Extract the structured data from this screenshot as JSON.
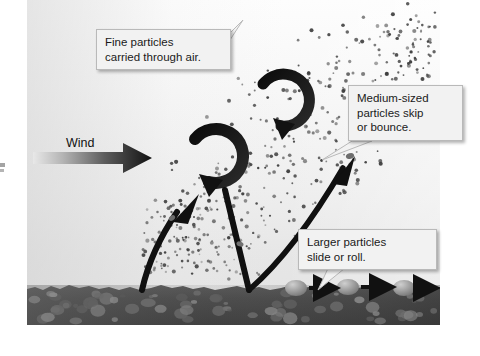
{
  "figure": {
    "type": "diagram",
    "panel": {
      "left": 27,
      "top": 0,
      "width": 413,
      "height": 325,
      "sky_color": "#eeeeee",
      "ground_color": "#4a4a4a",
      "ground_top": 277
    }
  },
  "wind": {
    "label": "Wind",
    "arrow": {
      "name": "wind-arrow",
      "direction": "right",
      "gradient_from": "#e3e3e3",
      "gradient_to": "#1a1a1a",
      "x1": 33,
      "y1": 158,
      "x2": 150,
      "y2": 158
    }
  },
  "callouts": [
    {
      "id": "fine",
      "text": "Fine particles\ncarried through air.",
      "box": {
        "left": 96,
        "top": 29,
        "width": 118
      },
      "tail_points": "214,55 244,22 214,70",
      "fill": "#f2f2f2",
      "border": "#b9b9b9"
    },
    {
      "id": "medium",
      "text": "Medium-sized\nparticles skip\nor bounce.",
      "box": {
        "left": 348,
        "top": 85,
        "width": 98
      },
      "tail_points": "352,143 322,160 372,143",
      "fill": "#f2f2f2",
      "border": "#b9b9b9"
    },
    {
      "id": "larger",
      "text": "Larger particles\nslide or roll.",
      "box": {
        "left": 298,
        "top": 229,
        "width": 122
      },
      "tail_points": "330,266 318,290 350,266",
      "fill": "#f2f2f2",
      "border": "#b9b9b9"
    }
  ],
  "swirls": [
    {
      "name": "swirl-upper",
      "cx": 280,
      "cy": 104,
      "r": 22,
      "note": "suspension eddy, upper"
    },
    {
      "name": "swirl-lower",
      "cx": 208,
      "cy": 155,
      "r": 24,
      "note": "suspension eddy, lower"
    }
  ],
  "trajectories": [
    {
      "name": "saltation-arc-left",
      "note": "particle leaving ground, rising left-to-right",
      "from": [
        140,
        288
      ],
      "to": [
        196,
        196
      ]
    },
    {
      "name": "saltation-descent",
      "note": "particle falling back to ground",
      "from": [
        225,
        195
      ],
      "to": [
        248,
        290
      ]
    },
    {
      "name": "saltation-arc-right",
      "note": "particle bouncing up to the right",
      "from": [
        248,
        290
      ],
      "to": [
        350,
        155
      ]
    }
  ],
  "creep": {
    "note": "larger particles sliding / rolling along the surface",
    "particles": [
      {
        "cx": 296,
        "cy": 288,
        "rx": 11,
        "ry": 8
      },
      {
        "cx": 348,
        "cy": 287,
        "rx": 11,
        "ry": 8
      },
      {
        "cx": 404,
        "cy": 288,
        "rx": 11,
        "ry": 8
      }
    ],
    "arrows": [
      {
        "x1": 309,
        "y1": 288,
        "x2": 337,
        "y2": 288
      },
      {
        "x1": 361,
        "y1": 287,
        "x2": 393,
        "y2": 287
      },
      {
        "x1": 417,
        "y1": 288,
        "x2": 441,
        "y2": 288
      }
    ]
  },
  "dust": {
    "note": "fine suspended particles drawn as a speckled field",
    "color": "#3a3a3a",
    "count": 430
  }
}
